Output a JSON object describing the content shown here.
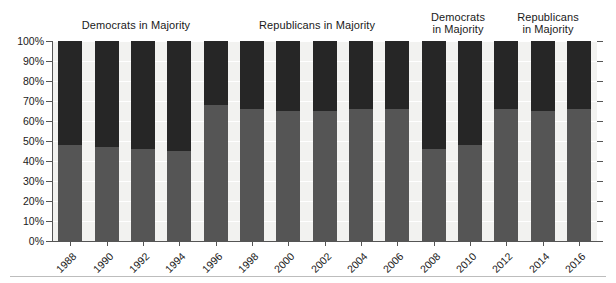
{
  "chart_data": {
    "type": "bar",
    "subtype": "stacked-100-percent",
    "title": "",
    "xlabel": "",
    "ylabel": "",
    "ylim": [
      0,
      100
    ],
    "ytick_labels": [
      "0%",
      "10%",
      "20%",
      "30%",
      "40%",
      "50%",
      "60%",
      "70%",
      "80%",
      "90%",
      "100%"
    ],
    "ytick_values": [
      0,
      10,
      20,
      30,
      40,
      50,
      60,
      70,
      80,
      90,
      100
    ],
    "grid": true,
    "legend": "none",
    "categories": [
      "1988",
      "1990",
      "1992",
      "1994",
      "1996",
      "1998",
      "2000",
      "2002",
      "2004",
      "2006",
      "2008",
      "2010",
      "2012",
      "2014",
      "2016"
    ],
    "series": [
      {
        "name": "lower-segment",
        "color": "#555555",
        "values": [
          48,
          47,
          46,
          45,
          68,
          66,
          65,
          65,
          66,
          66,
          46,
          48,
          66,
          65,
          66
        ]
      },
      {
        "name": "upper-segment",
        "color": "#262626",
        "values": [
          52,
          53,
          54,
          55,
          32,
          34,
          35,
          35,
          34,
          34,
          54,
          52,
          34,
          35,
          34
        ]
      }
    ],
    "annotations": [
      {
        "text": "Democrats in Majority",
        "spans_categories": [
          "1988",
          "1994"
        ],
        "lines": 1
      },
      {
        "text": "Republicans in Majority",
        "spans_categories": [
          "1996",
          "2006"
        ],
        "lines": 1
      },
      {
        "text": "Democrats\nin Majority",
        "spans_categories": [
          "2008",
          "2010"
        ],
        "lines": 2
      },
      {
        "text": "Republicans\nin Majority",
        "spans_categories": [
          "2012",
          "2016"
        ],
        "lines": 2
      }
    ]
  },
  "colors": {
    "upper_segment": "#262626",
    "lower_segment": "#555555",
    "plot_background": "#f2f2f0",
    "gridline": "#ffffff",
    "axis": "#555555",
    "text": "#1a1a1a"
  }
}
